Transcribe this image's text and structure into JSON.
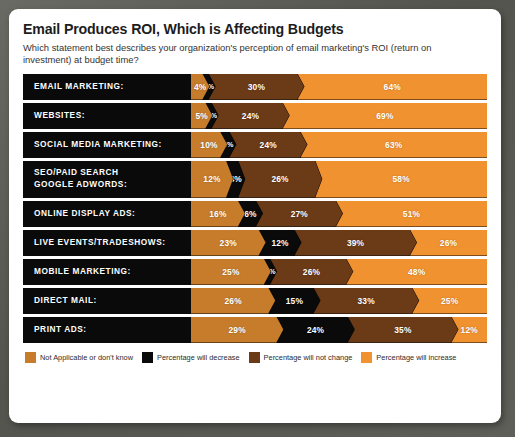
{
  "card": {
    "title": "Email Produces ROI, Which is Affecting Budgets",
    "subtitle": "Which statement best describes your organization's perception of email marketing's ROI (return on investment) at budget time?"
  },
  "colors": {
    "not_applicable": "#C67C2B",
    "decrease": "#0A0A0A",
    "not_change": "#6B3A16",
    "increase": "#F0922F",
    "row_background": "#0A0A0A",
    "card_background": "#FFFFFF",
    "frame": "#5D5D58",
    "label_text": "#FFFFFF",
    "title_text": "#1D1D1D"
  },
  "chart_data": {
    "type": "bar",
    "orientation": "horizontal",
    "stacked": true,
    "title": "Email Produces ROI, Which is Affecting Budgets",
    "subtitle": "Which statement best describes your organization's perception of email marketing's ROI (return on investment) at budget time?",
    "xlabel": "",
    "ylabel": "",
    "xlim": [
      0,
      100
    ],
    "grid": false,
    "legend_position": "bottom",
    "value_suffix": "%",
    "categories": [
      "EMAIL MARKETING:",
      "WEBSITES:",
      "SOCIAL MEDIA MARKETING:",
      "SEO/PAID SEARCH\nGOOGLE ADWORDS:",
      "ONLINE DISPLAY ADS:",
      "LIVE EVENTS/TRADESHOWS:",
      "MOBILE MARKETING:",
      "DIRECT MAIL:",
      "PRINT ADS:"
    ],
    "series": [
      {
        "name": "Not Applicable or don't know",
        "color": "#C67C2B",
        "values": [
          4,
          5,
          10,
          12,
          16,
          23,
          25,
          26,
          29
        ]
      },
      {
        "name": "Percentage will decrease",
        "color": "#0A0A0A",
        "values": [
          2,
          2,
          3,
          4,
          6,
          12,
          2,
          15,
          24
        ]
      },
      {
        "name": "Percentage will not change",
        "color": "#6B3A16",
        "values": [
          30,
          24,
          24,
          26,
          27,
          39,
          26,
          33,
          35
        ]
      },
      {
        "name": "Percentage will increase",
        "color": "#F0922F",
        "values": [
          64,
          69,
          63,
          58,
          51,
          26,
          48,
          25,
          12
        ]
      }
    ],
    "rows": [
      {
        "label": "EMAIL MARKETING:",
        "not_applicable": "4%",
        "decrease": "2%",
        "not_change": "30%",
        "increase": "64%"
      },
      {
        "label": "WEBSITES:",
        "not_applicable": "5%",
        "decrease": "2%",
        "not_change": "24%",
        "increase": "69%"
      },
      {
        "label": "SOCIAL MEDIA MARKETING:",
        "not_applicable": "10%",
        "decrease": "3%",
        "not_change": "24%",
        "increase": "63%"
      },
      {
        "label": "SEO/PAID SEARCH\nGOOGLE ADWORDS:",
        "not_applicable": "12%",
        "decrease": "4%",
        "not_change": "26%",
        "increase": "58%"
      },
      {
        "label": "ONLINE DISPLAY ADS:",
        "not_applicable": "16%",
        "decrease": "6%",
        "not_change": "27%",
        "increase": "51%"
      },
      {
        "label": "LIVE EVENTS/TRADESHOWS:",
        "not_applicable": "23%",
        "decrease": "12%",
        "not_change": "39%",
        "increase": "26%"
      },
      {
        "label": "MOBILE MARKETING:",
        "not_applicable": "25%",
        "decrease": "2%",
        "not_change": "26%",
        "increase": "48%"
      },
      {
        "label": "DIRECT MAIL:",
        "not_applicable": "26%",
        "decrease": "15%",
        "not_change": "33%",
        "increase": "25%"
      },
      {
        "label": "PRINT ADS:",
        "not_applicable": "29%",
        "decrease": "24%",
        "not_change": "35%",
        "increase": "12%"
      }
    ],
    "legend": [
      {
        "label": "Not Applicable or don't know",
        "color": "#C67C2B"
      },
      {
        "label": "Percentage will decrease",
        "color": "#0A0A0A"
      },
      {
        "label": "Percentage will not change",
        "color": "#6B3A16"
      },
      {
        "label": "Percentage will increase",
        "color": "#F0922F"
      }
    ]
  }
}
